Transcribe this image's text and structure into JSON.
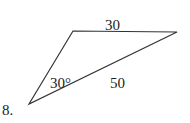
{
  "problem_number": "8.",
  "triangle": {
    "vertices": [
      [
        29,
        104
      ],
      [
        73,
        31
      ],
      [
        177,
        32
      ]
    ],
    "labels": {
      "top_side": "30",
      "bottom_side": "50",
      "angle": "30°"
    }
  }
}
